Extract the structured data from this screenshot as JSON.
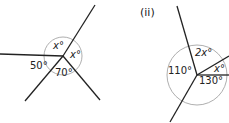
{
  "diagram_i": {
    "angles": [
      {
        "label": "x°",
        "var": "x"
      },
      {
        "label": "x°",
        "var": "x"
      },
      {
        "label": "50°",
        "value": 50
      },
      {
        "label": "70°",
        "value": 70
      }
    ]
  },
  "diagram_ii": {
    "label": "(ii)",
    "angles": [
      {
        "label": "2x°",
        "coef": "2",
        "var": "x"
      },
      {
        "label": "x°",
        "var": "x"
      },
      {
        "label": "110°",
        "value": 110
      },
      {
        "label": "130°",
        "value": 130
      }
    ]
  },
  "colors": {
    "line": "#222222",
    "arc": "#999999"
  }
}
